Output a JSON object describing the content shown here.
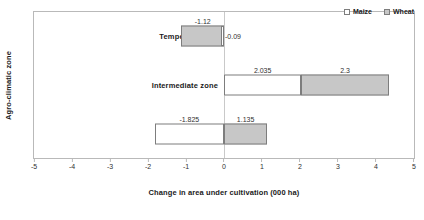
{
  "chart_data": {
    "type": "bar",
    "orientation": "horizontal",
    "stacked": true,
    "title": "",
    "xlabel": "Change in area under cultivation (000 ha)",
    "ylabel": "Agro-climatic zone",
    "xlim": [
      -5,
      5
    ],
    "xticks": [
      -5,
      -4,
      -3,
      -2,
      -1,
      0,
      1,
      2,
      3,
      4,
      5
    ],
    "xtick_labels": [
      "-5",
      "-4",
      "-3",
      "-2",
      "-1",
      "0",
      "1",
      "2",
      "3",
      "4",
      "5"
    ],
    "grid": false,
    "legend_position": "top-right",
    "categories": [
      "Temperate zone",
      "Intermediate zone",
      "Sub-tropical"
    ],
    "series": [
      {
        "name": "Maize",
        "color": "#ffffff",
        "values": [
          -0.09,
          2.035,
          -1.825
        ],
        "labels": [
          "-0.09",
          "2.035",
          "-1.825"
        ]
      },
      {
        "name": "Wheat",
        "color": "#c7c7c7",
        "values": [
          -1.12,
          2.3,
          1.135
        ],
        "labels": [
          "-1.12",
          "2.3",
          "1.135"
        ]
      }
    ],
    "bars": [
      {
        "category": "Temperate zone",
        "segments": [
          {
            "series": "Wheat",
            "value": -1.12,
            "label": "-1.12",
            "start": -1.12,
            "end": 0,
            "label_pos": "above"
          },
          {
            "series": "Maize",
            "value": -0.09,
            "label": "-0.09",
            "start": -0.09,
            "end": 0,
            "label_pos": "side"
          }
        ]
      },
      {
        "category": "Intermediate zone",
        "segments": [
          {
            "series": "Maize",
            "value": 2.035,
            "label": "2.035",
            "start": 0,
            "end": 2.035,
            "label_pos": "above"
          },
          {
            "series": "Wheat",
            "value": 2.3,
            "label": "2.3",
            "start": 2.035,
            "end": 4.335,
            "label_pos": "above"
          }
        ]
      },
      {
        "category": "Sub-tropical",
        "segments": [
          {
            "series": "Maize",
            "value": -1.825,
            "label": "-1.825",
            "start": -1.825,
            "end": 0,
            "label_pos": "above"
          },
          {
            "series": "Wheat",
            "value": 1.135,
            "label": "1.135",
            "start": 0,
            "end": 1.135,
            "label_pos": "above"
          }
        ]
      }
    ]
  },
  "legend": {
    "items": [
      {
        "label": "Maize",
        "swatch": "maize"
      },
      {
        "label": "Wheat",
        "swatch": "wheat"
      }
    ]
  }
}
